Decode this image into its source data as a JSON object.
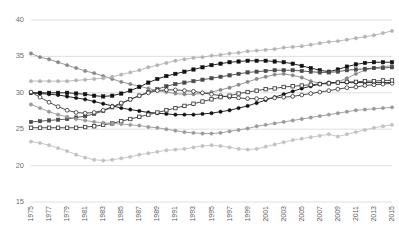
{
  "chart_data": {
    "type": "line",
    "title": "",
    "subtitle": "",
    "xlabel": "",
    "ylabel": "",
    "xlim": [
      1975,
      2015
    ],
    "ylim": [
      15,
      40
    ],
    "yticks": [
      15,
      20,
      25,
      30,
      35,
      40
    ],
    "grid": true,
    "legend": "none",
    "x": [
      1975,
      1976,
      1977,
      1978,
      1979,
      1980,
      1981,
      1982,
      1983,
      1984,
      1985,
      1986,
      1987,
      1988,
      1989,
      1990,
      1991,
      1992,
      1993,
      1994,
      1995,
      1996,
      1997,
      1998,
      1999,
      2000,
      2001,
      2002,
      2003,
      2004,
      2005,
      2006,
      2007,
      2008,
      2009,
      2010,
      2011,
      2012,
      2013,
      2014,
      2015
    ],
    "xtick_labels": [
      "1975",
      "1977",
      "1979",
      "1981",
      "1983",
      "1985",
      "1987",
      "1989",
      "1991",
      "1993",
      "1995",
      "1997",
      "1999",
      "2001",
      "2003",
      "2005",
      "2007",
      "2009",
      "2011",
      "2013",
      "2015"
    ],
    "series": [
      {
        "name": "series-1-descending-gray-dot",
        "marker": "filled-circle",
        "color": "#8a8a8a",
        "values": [
          35.4,
          34.9,
          34.6,
          34.2,
          33.8,
          33.4,
          33.0,
          32.7,
          32.3,
          31.9,
          31.5,
          31.2,
          30.9,
          30.6,
          30.3,
          30.1,
          29.9,
          29.8,
          29.8,
          29.9,
          30.1,
          30.4,
          30.7,
          31.1,
          31.5,
          31.9,
          32.2,
          32.5,
          32.6,
          32.4,
          32.1,
          31.6,
          31.3,
          31.2,
          31.5,
          32.0,
          32.6,
          33.1,
          33.4,
          33.6,
          33.7
        ]
      },
      {
        "name": "series-2-rising-light-gray-dot",
        "marker": "filled-circle",
        "color": "#b4b4b4",
        "values": [
          31.6,
          31.6,
          31.6,
          31.6,
          31.6,
          31.7,
          31.8,
          31.9,
          32.0,
          32.2,
          32.5,
          32.8,
          33.1,
          33.5,
          33.8,
          34.1,
          34.4,
          34.6,
          34.8,
          34.9,
          35.1,
          35.2,
          35.4,
          35.5,
          35.7,
          35.8,
          35.9,
          36.0,
          36.2,
          36.3,
          36.4,
          36.6,
          36.8,
          37.0,
          37.1,
          37.3,
          37.5,
          37.7,
          37.9,
          38.2,
          38.5
        ]
      },
      {
        "name": "series-3-black-square",
        "marker": "filled-square",
        "color": "#111111",
        "values": [
          30.0,
          30.0,
          30.0,
          30.0,
          30.0,
          29.9,
          29.8,
          29.6,
          29.5,
          29.6,
          29.9,
          30.3,
          30.8,
          31.4,
          31.9,
          32.3,
          32.6,
          32.9,
          33.2,
          33.5,
          33.8,
          34.0,
          34.2,
          34.3,
          34.4,
          34.4,
          34.4,
          34.3,
          34.2,
          34.0,
          33.7,
          33.4,
          33.1,
          32.9,
          33.2,
          33.6,
          33.9,
          34.1,
          34.2,
          34.2,
          34.2
        ]
      },
      {
        "name": "series-4-dark-gray-square",
        "marker": "filled-square",
        "color": "#4a4a4a",
        "values": [
          26.0,
          26.1,
          26.2,
          26.3,
          26.4,
          26.6,
          26.8,
          27.1,
          27.5,
          28.0,
          28.5,
          29.1,
          29.6,
          30.1,
          30.5,
          30.9,
          31.2,
          31.4,
          31.6,
          31.8,
          32.0,
          32.2,
          32.4,
          32.6,
          32.8,
          32.9,
          33.0,
          33.1,
          33.1,
          33.1,
          33.0,
          32.9,
          32.8,
          32.8,
          32.9,
          33.1,
          33.2,
          33.3,
          33.4,
          33.4,
          33.5
        ]
      },
      {
        "name": "series-5-black-circle",
        "marker": "filled-circle",
        "color": "#111111",
        "values": [
          30.0,
          29.9,
          29.8,
          29.7,
          29.5,
          29.3,
          29.1,
          28.8,
          28.5,
          28.2,
          27.9,
          27.7,
          27.5,
          27.3,
          27.2,
          27.1,
          27.0,
          27.0,
          27.0,
          27.1,
          27.2,
          27.4,
          27.6,
          27.9,
          28.2,
          28.6,
          29.0,
          29.4,
          29.8,
          30.2,
          30.6,
          30.9,
          31.2,
          31.4,
          31.4,
          31.4,
          31.4,
          31.4,
          31.4,
          31.4,
          31.4
        ]
      },
      {
        "name": "series-6-open-circle",
        "marker": "open-circle",
        "color": "#3a3a3a",
        "values": [
          30.1,
          29.4,
          28.7,
          28.1,
          27.6,
          27.3,
          27.2,
          27.3,
          27.6,
          28.1,
          28.6,
          29.1,
          29.6,
          30.0,
          30.3,
          30.4,
          30.4,
          30.3,
          30.2,
          30.0,
          29.8,
          29.6,
          29.4,
          29.3,
          29.2,
          29.2,
          29.2,
          29.3,
          29.4,
          29.5,
          29.7,
          29.9,
          30.1,
          30.3,
          30.5,
          30.7,
          30.8,
          31.0,
          31.1,
          31.2,
          31.3
        ]
      },
      {
        "name": "series-7-open-square",
        "marker": "open-square",
        "color": "#3a3a3a",
        "values": [
          25.2,
          25.2,
          25.2,
          25.2,
          25.2,
          25.2,
          25.3,
          25.4,
          25.6,
          25.8,
          26.1,
          26.4,
          26.7,
          27.0,
          27.3,
          27.6,
          27.9,
          28.2,
          28.5,
          28.8,
          29.1,
          29.4,
          29.6,
          29.9,
          30.1,
          30.3,
          30.5,
          30.6,
          30.8,
          30.9,
          31.0,
          31.1,
          31.2,
          31.3,
          31.4,
          31.5,
          31.5,
          31.6,
          31.6,
          31.7,
          31.7
        ]
      },
      {
        "name": "series-8-gray-dip-dot",
        "marker": "filled-circle",
        "color": "#9a9a9a",
        "values": [
          28.4,
          27.9,
          27.4,
          27.0,
          26.7,
          26.4,
          26.2,
          26.0,
          25.9,
          25.8,
          25.7,
          25.6,
          25.5,
          25.3,
          25.2,
          25.0,
          24.8,
          24.6,
          24.5,
          24.4,
          24.4,
          24.5,
          24.7,
          24.9,
          25.1,
          25.4,
          25.6,
          25.8,
          26.0,
          26.2,
          26.4,
          26.6,
          26.8,
          27.0,
          27.2,
          27.4,
          27.6,
          27.7,
          27.8,
          27.9,
          28.0
        ]
      },
      {
        "name": "series-9-lowest-light-gray",
        "marker": "filled-circle",
        "color": "#c2c2c2",
        "values": [
          23.3,
          23.1,
          22.8,
          22.4,
          22.0,
          21.5,
          21.1,
          20.8,
          20.7,
          20.8,
          21.0,
          21.2,
          21.5,
          21.7,
          21.9,
          22.1,
          22.2,
          22.3,
          22.5,
          22.7,
          22.8,
          22.7,
          22.5,
          22.3,
          22.2,
          22.3,
          22.6,
          22.9,
          23.2,
          23.5,
          23.7,
          23.9,
          24.1,
          24.3,
          24.0,
          24.3,
          24.6,
          24.9,
          25.2,
          25.4,
          25.6
        ]
      }
    ]
  },
  "axes": {
    "y_labels": [
      "40",
      "35",
      "30",
      "25",
      "20",
      "15"
    ],
    "x_labels": [
      "1975",
      "1977",
      "1979",
      "1981",
      "1983",
      "1985",
      "1987",
      "1989",
      "1991",
      "1993",
      "1995",
      "1997",
      "1999",
      "2001",
      "2003",
      "2005",
      "2007",
      "2009",
      "2011",
      "2013",
      "2015"
    ]
  },
  "colors": {
    "grid": "#d8d8d8",
    "tick_text": "#6f6f6f",
    "background": "#ffffff"
  }
}
